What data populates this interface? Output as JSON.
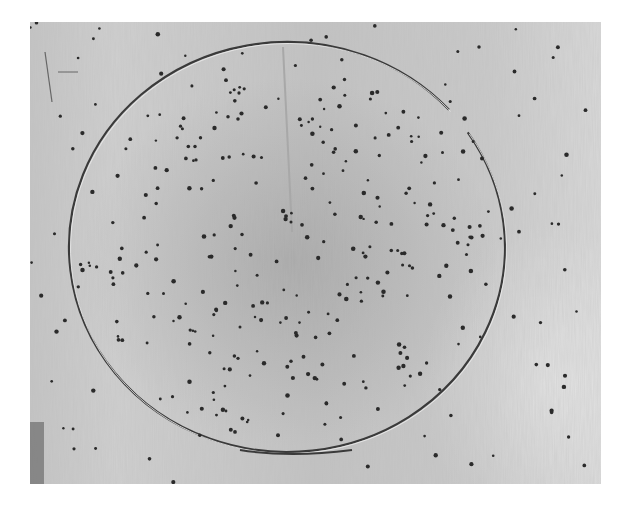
{
  "image": {
    "description": "Grayscale photograph of a metal surface with a large circular scratched ring and scattered dark pits",
    "background": "#ffffff",
    "photo_bounds": {
      "x": 30,
      "y": 22,
      "width": 571,
      "height": 462
    },
    "surface_color": "#c6c6c6",
    "ring": {
      "cx": 257,
      "cy": 225,
      "rx": 218,
      "ry": 205,
      "stroke": "#3a3a3a",
      "gap_angle_deg": -38
    },
    "dot_color": "#2a2a2a"
  }
}
